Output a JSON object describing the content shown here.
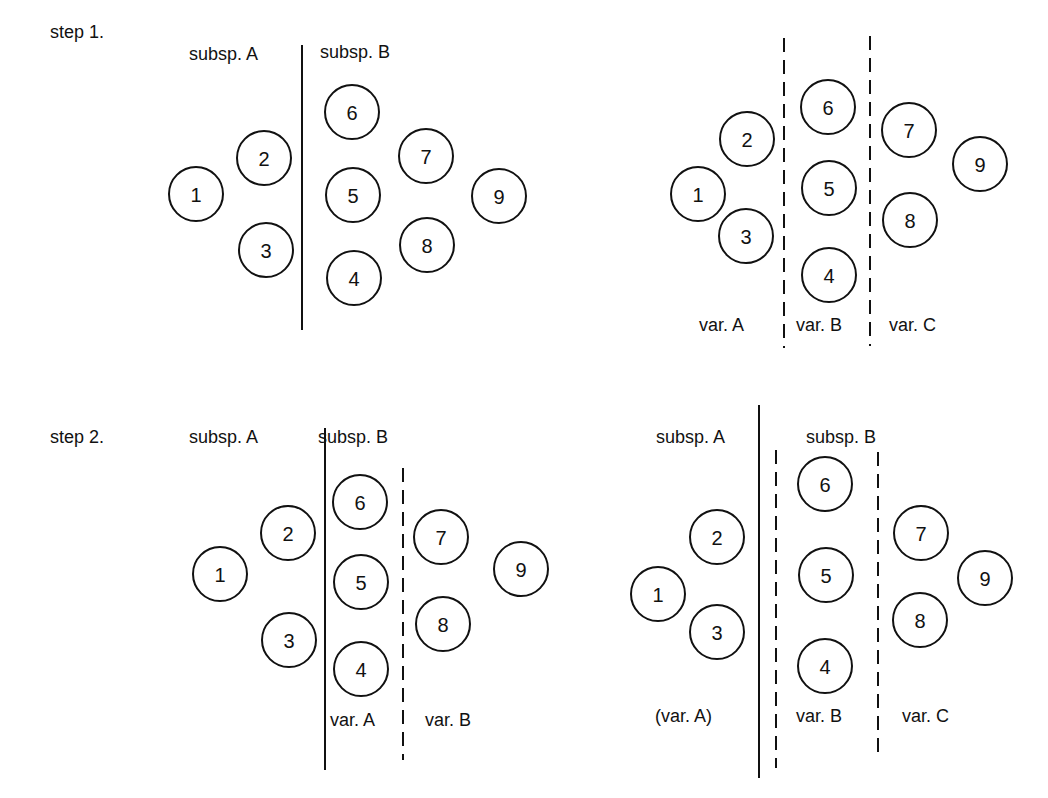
{
  "steps": [
    {
      "label": "step 1.",
      "x": 50,
      "y": 38
    },
    {
      "label": "step 2.",
      "x": 50,
      "y": 443
    }
  ],
  "panels": [
    {
      "id": "step1-subspecies",
      "circles": [
        {
          "n": "1",
          "x": 196,
          "y": 194
        },
        {
          "n": "2",
          "x": 264,
          "y": 158
        },
        {
          "n": "3",
          "x": 266,
          "y": 250
        },
        {
          "n": "6",
          "x": 352,
          "y": 112
        },
        {
          "n": "5",
          "x": 353,
          "y": 195
        },
        {
          "n": "4",
          "x": 354,
          "y": 278
        },
        {
          "n": "7",
          "x": 426,
          "y": 156
        },
        {
          "n": "8",
          "x": 427,
          "y": 245
        },
        {
          "n": "9",
          "x": 499,
          "y": 196
        }
      ],
      "lines": [
        {
          "type": "solid",
          "x": 302,
          "y1": 45,
          "y2": 330
        }
      ],
      "labels": [
        {
          "text": "subsp. A",
          "x": 189,
          "y": 60
        },
        {
          "text": "subsp. B",
          "x": 320,
          "y": 58
        }
      ]
    },
    {
      "id": "step1-varieties",
      "circles": [
        {
          "n": "1",
          "x": 698,
          "y": 194
        },
        {
          "n": "2",
          "x": 747,
          "y": 139
        },
        {
          "n": "3",
          "x": 746,
          "y": 236
        },
        {
          "n": "6",
          "x": 828,
          "y": 107
        },
        {
          "n": "5",
          "x": 829,
          "y": 188
        },
        {
          "n": "4",
          "x": 829,
          "y": 275
        },
        {
          "n": "7",
          "x": 909,
          "y": 130
        },
        {
          "n": "8",
          "x": 910,
          "y": 220
        },
        {
          "n": "9",
          "x": 980,
          "y": 164
        }
      ],
      "lines": [
        {
          "type": "dashed",
          "x": 784,
          "y1": 38,
          "y2": 348
        },
        {
          "type": "dashed",
          "x": 870,
          "y1": 36,
          "y2": 346
        }
      ],
      "labels": [
        {
          "text": "var. A",
          "x": 699,
          "y": 331
        },
        {
          "text": "var. B",
          "x": 796,
          "y": 331
        },
        {
          "text": "var. C",
          "x": 889,
          "y": 331
        }
      ]
    },
    {
      "id": "step2-varieties-in-subspB",
      "circles": [
        {
          "n": "1",
          "x": 220,
          "y": 574
        },
        {
          "n": "2",
          "x": 288,
          "y": 533
        },
        {
          "n": "3",
          "x": 289,
          "y": 640
        },
        {
          "n": "6",
          "x": 360,
          "y": 502
        },
        {
          "n": "5",
          "x": 361,
          "y": 582
        },
        {
          "n": "4",
          "x": 361,
          "y": 669
        },
        {
          "n": "7",
          "x": 441,
          "y": 537
        },
        {
          "n": "8",
          "x": 443,
          "y": 624
        },
        {
          "n": "9",
          "x": 521,
          "y": 569
        }
      ],
      "lines": [
        {
          "type": "solid",
          "x": 325,
          "y1": 428,
          "y2": 770
        },
        {
          "type": "dashed",
          "x": 403,
          "y1": 468,
          "y2": 760
        }
      ],
      "labels": [
        {
          "text": "subsp. A",
          "x": 189,
          "y": 443
        },
        {
          "text": "subsp. B",
          "x": 318,
          "y": 443
        },
        {
          "text": "var. A",
          "x": 330,
          "y": 726
        },
        {
          "text": "var. B",
          "x": 425,
          "y": 726
        }
      ]
    },
    {
      "id": "step2-all-varieties",
      "circles": [
        {
          "n": "1",
          "x": 658,
          "y": 594
        },
        {
          "n": "2",
          "x": 717,
          "y": 537
        },
        {
          "n": "3",
          "x": 717,
          "y": 632
        },
        {
          "n": "6",
          "x": 825,
          "y": 484
        },
        {
          "n": "5",
          "x": 826,
          "y": 575
        },
        {
          "n": "4",
          "x": 825,
          "y": 666
        },
        {
          "n": "7",
          "x": 921,
          "y": 533
        },
        {
          "n": "8",
          "x": 920,
          "y": 620
        },
        {
          "n": "9",
          "x": 985,
          "y": 578
        }
      ],
      "lines": [
        {
          "type": "solid",
          "x": 759,
          "y1": 405,
          "y2": 778
        },
        {
          "type": "dashed",
          "x": 776,
          "y1": 450,
          "y2": 768
        },
        {
          "type": "dashed",
          "x": 878,
          "y1": 452,
          "y2": 752
        }
      ],
      "labels": [
        {
          "text": "subsp. A",
          "x": 656,
          "y": 443
        },
        {
          "text": "subsp. B",
          "x": 806,
          "y": 443
        },
        {
          "text": "(var. A)",
          "x": 655,
          "y": 722
        },
        {
          "text": "var. B",
          "x": 796,
          "y": 722
        },
        {
          "text": "var. C",
          "x": 902,
          "y": 722
        }
      ]
    }
  ]
}
